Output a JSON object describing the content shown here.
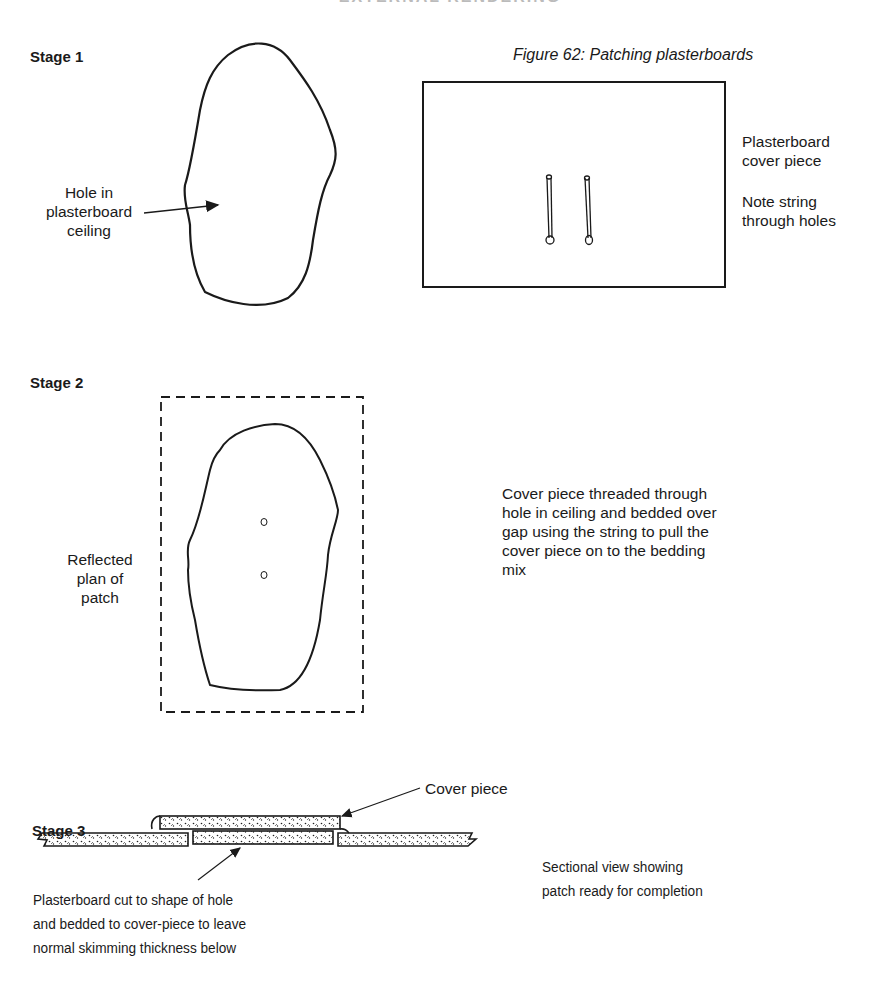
{
  "header": {
    "running_head": "EXTERNAL RENDERING"
  },
  "figure": {
    "caption": "Figure 62: Patching plasterboards"
  },
  "stage1": {
    "label": "Stage 1",
    "hole_label": [
      "Hole in",
      "plasterboard",
      "ceiling"
    ],
    "cover_label": [
      "Plasterboard",
      "cover piece"
    ],
    "note_label": [
      "Note string",
      "through holes"
    ]
  },
  "stage2": {
    "label": "Stage 2",
    "plan_label": [
      "Reflected",
      "plan of",
      "patch"
    ],
    "description": [
      "Cover piece threaded through",
      "hole in ceiling and bedded over",
      "gap using the string to pull the",
      "cover piece on to the bedding",
      "mix"
    ]
  },
  "stage3": {
    "label": "Stage 3",
    "cover_piece_label": "Cover piece",
    "cut_label": [
      "Plasterboard cut to shape of hole",
      "and bedded to cover-piece to leave",
      "normal skimming thickness below"
    ],
    "section_label": [
      "Sectional view showing",
      "patch ready for completion"
    ]
  },
  "colors": {
    "ink": "#1a1a1a",
    "paper": "#ffffff"
  }
}
